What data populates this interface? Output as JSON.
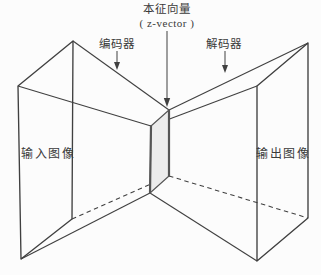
{
  "figure": {
    "labels": {
      "latent_cn": "本征向量",
      "latent_en": "( z-vector )",
      "encoder": "编码器",
      "decoder": "解码器",
      "input": "输入图像",
      "output": "输出图像"
    }
  },
  "colors": {
    "background": "#fcfcfc",
    "line": "#404040",
    "text": "#3a3a3a",
    "slab_fill": "#ececec",
    "slab_edge": "#555555"
  }
}
